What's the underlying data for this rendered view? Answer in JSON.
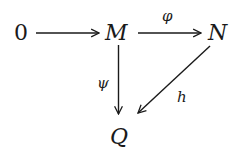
{
  "diagram": {
    "type": "commutative-diagram",
    "nodes": [
      {
        "id": "zero",
        "label": "0"
      },
      {
        "id": "M",
        "label": "M"
      },
      {
        "id": "N",
        "label": "N"
      },
      {
        "id": "Q",
        "label": "Q"
      }
    ],
    "edges": [
      {
        "from": "zero",
        "to": "M",
        "label": ""
      },
      {
        "from": "M",
        "to": "N",
        "label": "φ"
      },
      {
        "from": "M",
        "to": "Q",
        "label": "ψ"
      },
      {
        "from": "N",
        "to": "Q",
        "label": "h"
      }
    ],
    "colors": {
      "ink": "#1a1a1a",
      "background": "#ffffff"
    }
  }
}
